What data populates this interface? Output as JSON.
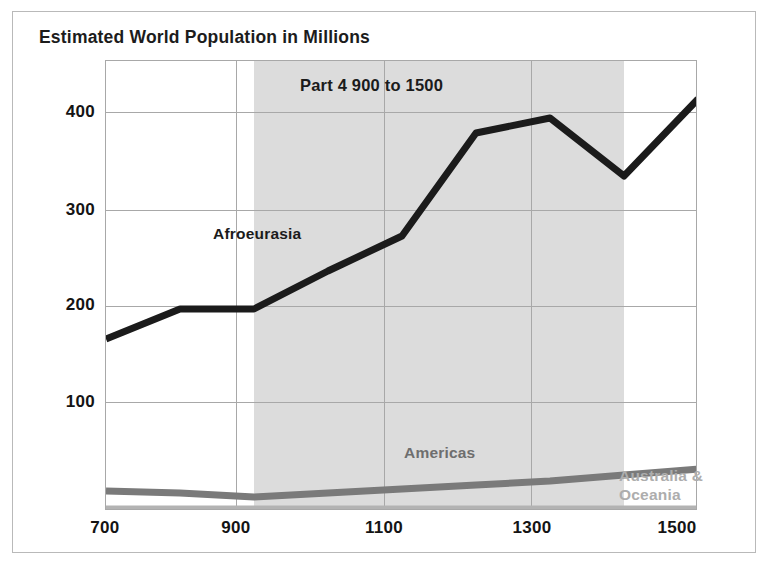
{
  "chart_data": {
    "type": "line",
    "title": "Estimated World Population in Millions",
    "xlabel": "",
    "ylabel": "",
    "xlim": [
      700,
      1500
    ],
    "ylim": [
      0,
      450
    ],
    "xticks": [
      "700",
      "900",
      "1100",
      "1300",
      "1500"
    ],
    "yticks": [
      "100",
      "200",
      "300",
      "400"
    ],
    "grid": true,
    "legend_position": "inline-labels",
    "annotations": [
      {
        "text": "Part 4 900 to 1500",
        "x": 1150,
        "y": 430
      }
    ],
    "highlight_band": {
      "from": 900,
      "to": 1400,
      "color": "#dcdcdc"
    },
    "x": [
      700,
      800,
      900,
      1000,
      1100,
      1200,
      1300,
      1400,
      1500
    ],
    "series": [
      {
        "name": "Afroeurasia",
        "color": "#1b1b1b",
        "values": [
          172,
          202,
          202,
          240,
          275,
          378,
          393,
          335,
          412
        ]
      },
      {
        "name": "Americas",
        "color": "#7a7a7a",
        "values": [
          20,
          18,
          14,
          18,
          22,
          26,
          30,
          36,
          42
        ]
      },
      {
        "name": "Australia & Oceania",
        "color": "#b3b3b3",
        "values": [
          2,
          2,
          2,
          2,
          2,
          2,
          2,
          2,
          2
        ]
      }
    ]
  },
  "labels": {
    "afroeurasia": "Afroeurasia",
    "americas": "Americas",
    "australia_line1": "Australia &",
    "australia_line2": "Oceania"
  },
  "colors": {
    "frame": "#b9b9b9",
    "axis": "#a8a8a8",
    "band": "#dcdcdc",
    "afroeurasia": "#1b1b1b",
    "americas": "#7a7a7a",
    "australia": "#b3b3b3",
    "text": "#141414"
  }
}
